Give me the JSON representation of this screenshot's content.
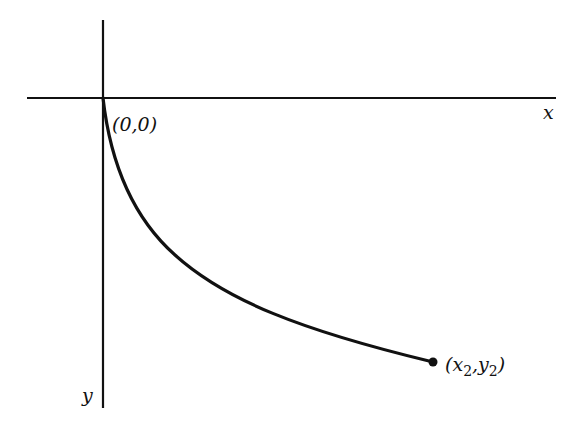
{
  "diagram": {
    "type": "curve-on-axes",
    "axes": {
      "x_label": "x",
      "y_label": "y",
      "y_direction": "downward"
    },
    "points": {
      "origin": {
        "label": "(0,0)"
      },
      "endpoint": {
        "label_x": "x",
        "label_x_sub": "2",
        "label_y": "y",
        "label_y_sub": "2",
        "open_paren": "(",
        "comma": ",",
        "close_paren": ")"
      }
    },
    "colors": {
      "ink": "#111111",
      "background": "#ffffff"
    }
  }
}
